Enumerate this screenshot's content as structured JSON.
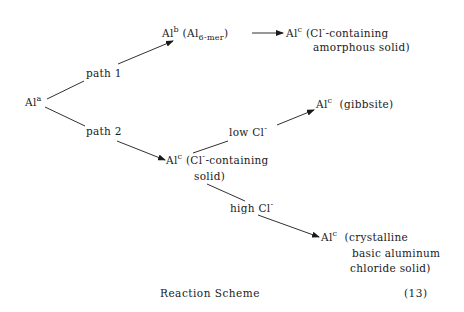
{
  "scheme": {
    "start": {
      "base": "Al",
      "sup": "a"
    },
    "path1": {
      "label": "path 1",
      "intermediate": {
        "base": "Al",
        "sup": "b",
        "paren_open": "(Al",
        "sub": "6-mer",
        "paren_close": ")"
      },
      "product": {
        "base": "Al",
        "sup": "c",
        "line1_pre": "(Cl",
        "line1_sup": "-",
        "line1_post": "-containing",
        "line2": "amorphous solid)"
      }
    },
    "path2": {
      "label": "path 2",
      "intermediate": {
        "base": "Al",
        "sup": "c",
        "line1_pre": "(Cl",
        "line1_sup": "-",
        "line1_post": "-containing",
        "line2": "solid)"
      },
      "low_branch": {
        "label_pre": "low Cl",
        "label_sup": "-",
        "product": {
          "base": "Al",
          "sup": "c",
          "desc": "(gibbsite)"
        }
      },
      "high_branch": {
        "label_pre": "high Cl",
        "label_sup": "-",
        "product": {
          "base": "Al",
          "sup": "c",
          "line1": "(crystalline",
          "line2": "basic aluminum",
          "line3": "chloride solid)"
        }
      }
    }
  },
  "caption": {
    "title": "Reaction Scheme",
    "number": "(13)"
  }
}
